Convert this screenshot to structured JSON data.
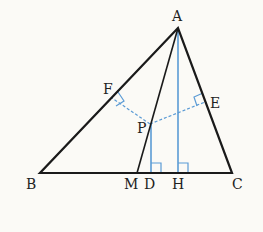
{
  "diagram": {
    "type": "geometry-triangle",
    "colors": {
      "triangle": "#1a1a1a",
      "perpendiculars": "#5b9bd5",
      "background": "#fbfaf6"
    },
    "labels": {
      "A": "A",
      "B": "B",
      "C": "C",
      "M": "M",
      "D": "D",
      "H": "H",
      "P": "P",
      "E": "E",
      "F": "F"
    },
    "points": {
      "A": [
        178,
        28
      ],
      "B": [
        40,
        173
      ],
      "C": [
        232,
        173
      ],
      "M": [
        137,
        173
      ],
      "D": [
        151,
        173
      ],
      "H": [
        178,
        173
      ],
      "P": [
        150,
        124
      ],
      "F": [
        112,
        97
      ],
      "E": [
        205,
        102
      ]
    },
    "segments": {
      "solid_black": [
        "AB",
        "BC",
        "CA",
        "AM"
      ],
      "solid_blue": [
        "AH",
        "PD"
      ],
      "dashed_blue": [
        "PF",
        "PE"
      ]
    },
    "right_angles": [
      "F",
      "E",
      "D",
      "H"
    ]
  }
}
